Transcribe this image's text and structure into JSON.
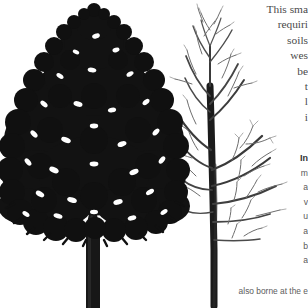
{
  "page": {
    "background_color": "#ffffff",
    "width": 308,
    "height": 308
  },
  "illustration": {
    "name": "two-tree-botanical-illustration",
    "description": "Black ink illustration of two trees side by side",
    "ink_color": "#111111",
    "twig_color": "#6e6e6e",
    "trees": [
      {
        "name": "leafy-tree",
        "label": "tree in full leaf",
        "position": "left",
        "foliage": "dense dark canopy",
        "trunk": "thick straight bole"
      },
      {
        "name": "bare-tree",
        "label": "tree in winter silhouette",
        "position": "center-right",
        "foliage": "none",
        "trunk": "slender trunk with fine branching twigs"
      }
    ]
  },
  "text": {
    "body": {
      "color": "#4a4a4a",
      "lines": [
        "This sma",
        "requiri",
        "soils",
        "wes",
        "be",
        "t",
        "l",
        "i"
      ]
    },
    "subsection": {
      "color": "#5a5a5a",
      "heading_color": "#333333",
      "lines": [
        "In",
        "m",
        "a",
        "v",
        "u",
        "a",
        "b",
        "a"
      ],
      "bold_line_index": 0
    },
    "caption": {
      "color": "#5d5d5d",
      "value": "also borne at the e"
    }
  }
}
